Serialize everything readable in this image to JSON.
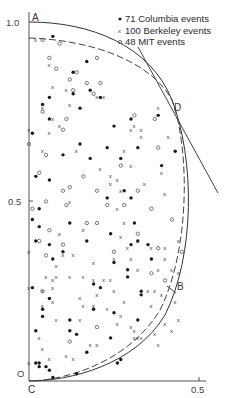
{
  "chart_data": {
    "type": "scatter",
    "title": "",
    "xlabel": "",
    "ylabel": "",
    "xlim": [
      0,
      0.5
    ],
    "ylim": [
      0,
      1.0
    ],
    "grid": false,
    "x_ticks": [
      "0.5"
    ],
    "y_ticks": [
      "0.5",
      "1.0"
    ],
    "origin_label": "O",
    "legend_position": "top-right",
    "legend": [
      {
        "marker": "filled-dot",
        "label": "71 Columbia events"
      },
      {
        "marker": "x",
        "label": "100 Berkeley events"
      },
      {
        "marker": "open-circle",
        "label": "48 MIT events"
      }
    ],
    "point_labels": {
      "A": "A",
      "B": "B",
      "C": "C",
      "D": "D"
    },
    "curves": [
      {
        "name": "outer-boundary-solid",
        "style": "solid",
        "description": "Boundary from A(0,1.0) through D to C(0,0)"
      },
      {
        "name": "inner-boundary-dashed",
        "style": "dashed",
        "description": "Inner boundary from (0,0.95) through D to C"
      },
      {
        "name": "tangent-line",
        "style": "solid",
        "description": "Straight line tangent at D"
      }
    ],
    "series": [
      {
        "name": "Columbia",
        "marker": "filled-dot",
        "count": 71,
        "points": [
          [
            0.07,
            0.96
          ],
          [
            0.17,
            0.89
          ],
          [
            0.13,
            0.86
          ],
          [
            0.18,
            0.81
          ],
          [
            0.06,
            0.79
          ],
          [
            0.13,
            0.8
          ],
          [
            0.21,
            0.79
          ],
          [
            0.04,
            0.77
          ],
          [
            0.15,
            0.76
          ],
          [
            0.3,
            0.73
          ],
          [
            0.06,
            0.73
          ],
          [
            0.38,
            0.74
          ],
          [
            0.25,
            0.71
          ],
          [
            0.01,
            0.69
          ],
          [
            0.15,
            0.66
          ],
          [
            0.23,
            0.65
          ],
          [
            0.32,
            0.65
          ],
          [
            0.18,
            0.62
          ],
          [
            0.1,
            0.63
          ],
          [
            0.27,
            0.62
          ],
          [
            0.39,
            0.6
          ],
          [
            0.02,
            0.57
          ],
          [
            0.06,
            0.56
          ],
          [
            0.28,
            0.53
          ],
          [
            0.23,
            0.51
          ],
          [
            0.3,
            0.51
          ],
          [
            0.03,
            0.48
          ],
          [
            0.01,
            0.45
          ],
          [
            0.03,
            0.43
          ],
          [
            0.12,
            0.44
          ],
          [
            0.24,
            0.41
          ],
          [
            0.02,
            0.39
          ],
          [
            0.06,
            0.38
          ],
          [
            0.17,
            0.39
          ],
          [
            0.3,
            0.38
          ],
          [
            0.32,
            0.39
          ],
          [
            0.35,
            0.38
          ],
          [
            0.07,
            0.34
          ],
          [
            0.25,
            0.33
          ],
          [
            0.36,
            0.34
          ],
          [
            0.29,
            0.31
          ],
          [
            0.01,
            0.26
          ],
          [
            0.19,
            0.27
          ],
          [
            0.21,
            0.26
          ],
          [
            0.33,
            0.24
          ],
          [
            0.29,
            0.29
          ],
          [
            0.19,
            0.2
          ],
          [
            0.25,
            0.19
          ],
          [
            0.04,
            0.2
          ],
          [
            0.04,
            0.18
          ],
          [
            0.12,
            0.17
          ],
          [
            0.14,
            0.13
          ],
          [
            0.24,
            0.12
          ],
          [
            0.06,
            0.23
          ],
          [
            0.33,
            0.25
          ],
          [
            0.12,
            0.14
          ],
          [
            0.02,
            0.14
          ],
          [
            0.17,
            0.08
          ],
          [
            0.32,
            0.17
          ],
          [
            0.26,
            0.05
          ],
          [
            0.27,
            0.06
          ],
          [
            0.02,
            0.05
          ],
          [
            0.05,
            0.04
          ],
          [
            0.03,
            0.05
          ],
          [
            0.06,
            0.03
          ],
          [
            0.03,
            0.04
          ],
          [
            0.07,
            0.01
          ],
          [
            0.14,
            0.02
          ],
          [
            0.43,
            0.64
          ],
          [
            0.31,
            0.44
          ],
          [
            0.1,
            0.36
          ]
        ]
      },
      {
        "name": "Berkeley",
        "marker": "x",
        "count": 100,
        "points": [
          [
            0.02,
            0.95
          ],
          [
            0.06,
            0.88
          ],
          [
            0.07,
            0.82
          ],
          [
            0.11,
            0.81
          ],
          [
            0.12,
            0.77
          ],
          [
            0.2,
            0.79
          ],
          [
            0.22,
            0.79
          ],
          [
            0.04,
            0.76
          ],
          [
            0.07,
            0.73
          ],
          [
            0.06,
            0.69
          ],
          [
            0.09,
            0.71
          ],
          [
            0.31,
            0.71
          ],
          [
            0.3,
            0.7
          ],
          [
            0.33,
            0.7
          ],
          [
            0.33,
            0.68
          ],
          [
            0.38,
            0.76
          ],
          [
            0.41,
            0.68
          ],
          [
            0.0,
            0.7
          ],
          [
            0.04,
            0.64
          ],
          [
            0.14,
            0.64
          ],
          [
            0.28,
            0.64
          ],
          [
            0.3,
            0.6
          ],
          [
            0.21,
            0.59
          ],
          [
            0.24,
            0.57
          ],
          [
            0.26,
            0.56
          ],
          [
            0.24,
            0.55
          ],
          [
            0.34,
            0.55
          ],
          [
            0.39,
            0.58
          ],
          [
            0.27,
            0.53
          ],
          [
            0.4,
            0.52
          ],
          [
            0.26,
            0.48
          ],
          [
            0.12,
            0.5
          ],
          [
            0.28,
            0.44
          ],
          [
            0.09,
            0.41
          ],
          [
            0.16,
            0.42
          ],
          [
            0.27,
            0.4
          ],
          [
            0.32,
            0.39
          ],
          [
            0.29,
            0.37
          ],
          [
            0.36,
            0.37
          ],
          [
            0.4,
            0.37
          ],
          [
            0.44,
            0.39
          ],
          [
            0.0,
            0.36
          ],
          [
            0.1,
            0.35
          ],
          [
            0.13,
            0.35
          ],
          [
            0.25,
            0.34
          ],
          [
            0.3,
            0.34
          ],
          [
            0.4,
            0.34
          ],
          [
            0.08,
            0.32
          ],
          [
            0.19,
            0.33
          ],
          [
            0.32,
            0.31
          ],
          [
            0.42,
            0.31
          ],
          [
            0.38,
            0.31
          ],
          [
            0.44,
            0.3
          ],
          [
            0.05,
            0.29
          ],
          [
            0.07,
            0.28
          ],
          [
            0.08,
            0.29
          ],
          [
            0.12,
            0.29
          ],
          [
            0.16,
            0.29
          ],
          [
            0.19,
            0.28
          ],
          [
            0.22,
            0.28
          ],
          [
            0.24,
            0.28
          ],
          [
            0.0,
            0.26
          ],
          [
            0.04,
            0.25
          ],
          [
            0.07,
            0.26
          ],
          [
            0.15,
            0.23
          ],
          [
            0.2,
            0.24
          ],
          [
            0.25,
            0.25
          ],
          [
            0.28,
            0.22
          ],
          [
            0.35,
            0.25
          ],
          [
            0.37,
            0.25
          ],
          [
            0.39,
            0.24
          ],
          [
            0.43,
            0.22
          ],
          [
            0.04,
            0.21
          ],
          [
            0.07,
            0.22
          ],
          [
            0.16,
            0.21
          ],
          [
            0.19,
            0.21
          ],
          [
            0.23,
            0.2
          ],
          [
            0.36,
            0.21
          ],
          [
            0.08,
            0.17
          ],
          [
            0.15,
            0.17
          ],
          [
            0.26,
            0.16
          ],
          [
            0.3,
            0.15
          ],
          [
            0.4,
            0.16
          ],
          [
            0.37,
            0.13
          ],
          [
            0.42,
            0.14
          ],
          [
            0.27,
            0.18
          ],
          [
            0.31,
            0.12
          ],
          [
            0.32,
            0.12
          ],
          [
            0.33,
            0.12
          ],
          [
            0.44,
            0.17
          ],
          [
            0.38,
            0.1
          ],
          [
            0.04,
            0.09
          ],
          [
            0.06,
            0.06
          ],
          [
            0.11,
            0.07
          ],
          [
            0.13,
            0.06
          ],
          [
            0.18,
            0.1
          ],
          [
            0.2,
            0.1
          ],
          [
            0.31,
            0.14
          ],
          [
            0.0,
            0.05
          ],
          [
            0.03,
            0.12
          ]
        ]
      },
      {
        "name": "MIT",
        "marker": "open-circle",
        "count": 48,
        "points": [
          [
            0.04,
            0.95
          ],
          [
            0.09,
            0.94
          ],
          [
            0.06,
            0.9
          ],
          [
            0.14,
            0.86
          ],
          [
            0.08,
            0.87
          ],
          [
            0.2,
            0.9
          ],
          [
            0.12,
            0.84
          ],
          [
            0.17,
            0.83
          ],
          [
            0.21,
            0.83
          ],
          [
            0.13,
            0.81
          ],
          [
            0.19,
            0.8
          ],
          [
            0.04,
            0.75
          ],
          [
            0.11,
            0.73
          ],
          [
            0.31,
            0.74
          ],
          [
            0.37,
            0.73
          ],
          [
            0.1,
            0.7
          ],
          [
            0.38,
            0.65
          ],
          [
            0.27,
            0.6
          ],
          [
            0.16,
            0.57
          ],
          [
            0.05,
            0.63
          ],
          [
            0.0,
            0.66
          ],
          [
            0.03,
            0.58
          ],
          [
            0.12,
            0.54
          ],
          [
            0.2,
            0.53
          ],
          [
            0.32,
            0.53
          ],
          [
            0.1,
            0.53
          ],
          [
            0.05,
            0.5
          ],
          [
            0.28,
            0.49
          ],
          [
            0.23,
            0.49
          ],
          [
            0.11,
            0.49
          ],
          [
            0.36,
            0.48
          ],
          [
            0.01,
            0.48
          ],
          [
            0.17,
            0.44
          ],
          [
            0.2,
            0.44
          ],
          [
            0.42,
            0.45
          ],
          [
            0.03,
            0.39
          ],
          [
            0.1,
            0.38
          ],
          [
            0.05,
            0.35
          ],
          [
            0.06,
            0.42
          ],
          [
            0.25,
            0.36
          ],
          [
            0.38,
            0.37
          ],
          [
            0.45,
            0.36
          ],
          [
            0.32,
            0.41
          ],
          [
            0.36,
            0.3
          ],
          [
            0.4,
            0.28
          ],
          [
            0.04,
            0.25
          ],
          [
            0.2,
            0.15
          ],
          [
            0.12,
            0.11
          ]
        ]
      }
    ]
  }
}
